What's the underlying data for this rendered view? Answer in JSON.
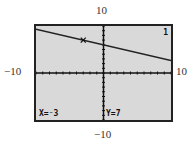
{
  "chart_data": {
    "type": "line",
    "title": "",
    "xlabel": "",
    "ylabel": "",
    "xlim": [
      -10,
      10
    ],
    "ylim": [
      -10,
      10
    ],
    "grid": false,
    "axis_labels": {
      "top": "10",
      "bottom": "-10",
      "left": "-10",
      "right": "10"
    },
    "series": [
      {
        "name": "Y1",
        "equation": "y = -x/3 + 6",
        "x": [
          -10,
          10
        ],
        "y": [
          9.333,
          2.667
        ]
      }
    ],
    "trace_point": {
      "x": -3,
      "y": 7
    },
    "annotations": [
      "X=-3",
      "Y=7",
      "1"
    ]
  },
  "labels": {
    "top": "10",
    "bottom": "−10",
    "left": "−10",
    "right": "10"
  },
  "screen": {
    "x_readout": "X=⁻3",
    "y_readout": "Y=7",
    "plot_number": "1"
  }
}
